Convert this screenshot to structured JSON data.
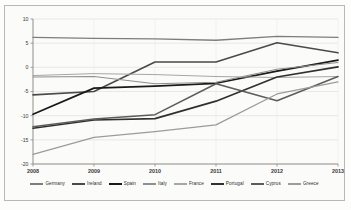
{
  "chart_data": {
    "type": "line",
    "title": "",
    "subtitle": "",
    "xlabel": "",
    "ylabel": "",
    "x": [
      "2008",
      "2009",
      "2010",
      "2011",
      "2012",
      "2013"
    ],
    "xtick_labels": [
      "2008",
      "2009",
      "2010",
      "2011",
      "2012",
      "2013"
    ],
    "ytick_labels": [
      "10",
      "5",
      "0",
      "-5",
      "-10",
      "-15",
      "-20"
    ],
    "ytick_values": [
      10,
      5,
      0,
      -5,
      -10,
      -15,
      -20
    ],
    "ylim": [
      -20,
      10
    ],
    "grid": true,
    "legend_position": "bottom",
    "series": [
      {
        "name": "Germany",
        "color": "#7d7d7d",
        "width": 1.3,
        "values": [
          6.2,
          6.0,
          5.9,
          5.6,
          6.4,
          6.2
        ]
      },
      {
        "name": "Ireland",
        "color": "#4a4a4a",
        "width": 1.6,
        "values": [
          -5.7,
          -5.0,
          1.1,
          1.1,
          5.1,
          3.0
        ]
      },
      {
        "name": "Spain",
        "color": "#1a1a1a",
        "width": 1.7,
        "values": [
          -9.7,
          -4.3,
          -3.9,
          -3.3,
          -0.8,
          1.5
        ]
      },
      {
        "name": "Italy",
        "color": "#8f8f8f",
        "width": 1.1,
        "values": [
          -2.0,
          -1.9,
          -3.4,
          -3.1,
          -0.4,
          1.0
        ]
      },
      {
        "name": "France",
        "color": "#a6a6a6",
        "width": 1.0,
        "values": [
          -1.7,
          -1.3,
          -1.5,
          -1.9,
          -2.1,
          -1.9
        ]
      },
      {
        "name": "Portugal",
        "color": "#303030",
        "width": 1.7,
        "values": [
          -12.6,
          -10.9,
          -10.6,
          -7.0,
          -2.0,
          0.1
        ]
      },
      {
        "name": "Cyprus",
        "color": "#5c5c5c",
        "width": 1.5,
        "values": [
          -12.3,
          -10.7,
          -9.8,
          -3.4,
          -6.9,
          -1.9
        ]
      },
      {
        "name": "Greece",
        "color": "#9b9b9b",
        "width": 1.2,
        "values": [
          -18.0,
          -14.5,
          -13.3,
          -11.9,
          -5.5,
          -3.0
        ]
      }
    ]
  },
  "legend": {
    "items": [
      {
        "label": "Germany"
      },
      {
        "label": "Ireland"
      },
      {
        "label": "Spain"
      },
      {
        "label": "Italy"
      },
      {
        "label": "France"
      },
      {
        "label": "Portugal"
      },
      {
        "label": "Cyprus"
      },
      {
        "label": "Greece"
      }
    ]
  }
}
